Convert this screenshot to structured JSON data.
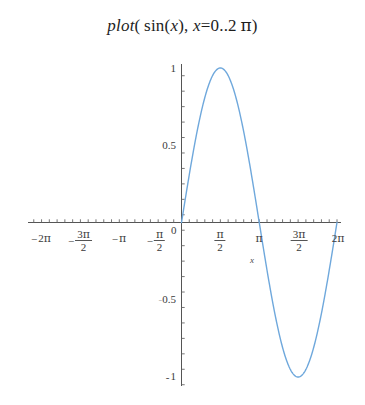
{
  "figure": {
    "background_color": "#ffffff",
    "title": {
      "full_text": "plot( sin(x), x = 0 ..2 π)",
      "fn_name": "plot",
      "open_paren": "(",
      "inner_fn": "sin",
      "inner_open": "(",
      "inner_var": "x",
      "inner_close": ")",
      "comma": ",",
      "range_var": "x",
      "equals": "=",
      "range_start": "0",
      "range_dots": "..",
      "range_end_coeff": "2",
      "range_end_symbol": "π",
      "close_paren": ")"
    }
  },
  "chart_data": {
    "type": "line",
    "xlabel": "x",
    "ylabel": "",
    "grid": false,
    "legend": null,
    "xlim": [
      -6.283185307,
      6.283185307
    ],
    "ylim": [
      -1,
      1
    ],
    "x_tick_labels": [
      "-2 π",
      "-3 π/2",
      "-π",
      "-π/2",
      "0",
      "π/2",
      "π",
      "3 π/2",
      "2 π"
    ],
    "x_tick_values": [
      -6.283185307,
      -4.71238898,
      -3.141592653,
      -1.570796327,
      0,
      1.570796327,
      3.141592653,
      4.71238898,
      6.283185307
    ],
    "y_tick_labels": [
      "1",
      "0.5",
      "0",
      "-0.5",
      "-1"
    ],
    "y_tick_values": [
      1,
      0.5,
      0,
      -0.5,
      -1
    ],
    "minor_tick_step_x": 0.3141592653,
    "minor_tick_step_y": 0.1,
    "series": [
      {
        "name": "sin(x)",
        "color": "#6fa8dc",
        "line_width": 1.4,
        "domain": [
          0,
          6.283185307
        ],
        "x": [
          0,
          0.1963,
          0.3927,
          0.589,
          0.7854,
          0.9817,
          1.1781,
          1.3744,
          1.5708,
          1.7671,
          1.9635,
          2.1598,
          2.3562,
          2.5525,
          2.7489,
          2.9452,
          3.1416,
          3.3379,
          3.5343,
          3.7306,
          3.927,
          4.1233,
          4.3197,
          4.516,
          4.7124,
          4.9087,
          5.1051,
          5.3014,
          5.4978,
          5.6941,
          5.8905,
          6.0868,
          6.2832
        ],
        "y": [
          0,
          0.1951,
          0.3827,
          0.5556,
          0.7071,
          0.8315,
          0.9239,
          0.9808,
          1,
          0.9808,
          0.9239,
          0.8315,
          0.7071,
          0.5556,
          0.3827,
          0.1951,
          0,
          -0.1951,
          -0.3827,
          -0.5556,
          -0.7071,
          -0.8315,
          -0.9239,
          -0.9808,
          -1,
          -0.9808,
          -0.9239,
          -0.8315,
          -0.7071,
          -0.5556,
          -0.3827,
          -0.1951,
          0
        ]
      }
    ]
  },
  "x_axis": {
    "variable_label": "x",
    "ticks": [
      {
        "id": "neg-2pi",
        "label_plain": "-2 π",
        "sign": "−",
        "coeff": "2",
        "symbol": "π",
        "fraction": false,
        "value": -6.283185307,
        "px": 41
      },
      {
        "id": "neg-3pi-over-2",
        "label_plain": "-3 π/2",
        "sign": "−",
        "coeff": "3",
        "symbol": "π",
        "fraction": true,
        "denominator": "2",
        "value": -4.71238898,
        "px": 80
      },
      {
        "id": "neg-pi",
        "label_plain": "-π",
        "sign": "−",
        "coeff": "",
        "symbol": "π",
        "fraction": false,
        "value": -3.141592653,
        "px": 119
      },
      {
        "id": "neg-pi-over-2",
        "label_plain": "-π/2",
        "sign": "−",
        "coeff": "",
        "symbol": "π",
        "fraction": true,
        "denominator": "2",
        "value": -1.570796327,
        "px": 155
      },
      {
        "id": "origin",
        "label_plain": "0",
        "sign": "",
        "coeff": "0",
        "symbol": "",
        "fraction": false,
        "value": 0,
        "px": 175
      },
      {
        "id": "pi-over-2",
        "label_plain": "π/2",
        "sign": "",
        "coeff": "",
        "symbol": "π",
        "fraction": true,
        "denominator": "2",
        "value": 1.570796327,
        "px": 220
      },
      {
        "id": "pi",
        "label_plain": "π",
        "sign": "",
        "coeff": "",
        "symbol": "π",
        "fraction": false,
        "value": 3.141592653,
        "px": 259
      },
      {
        "id": "3pi-over-2",
        "label_plain": "3 π/2",
        "sign": "",
        "coeff": "3",
        "symbol": "π",
        "fraction": true,
        "denominator": "2",
        "value": 4.71238898,
        "px": 298
      },
      {
        "id": "2pi",
        "label_plain": "2 π",
        "sign": "",
        "coeff": "2",
        "symbol": "π",
        "fraction": false,
        "value": 6.283185307,
        "px": 337
      }
    ]
  },
  "y_axis": {
    "ticks": [
      {
        "id": "y-1",
        "label": "1",
        "value": 1,
        "px": 68
      },
      {
        "id": "y-0-5",
        "label": "0.5",
        "value": 0.5,
        "px": 145
      },
      {
        "id": "y-neg-0-5",
        "label": "0.5",
        "negative_faint": "-",
        "value": -0.5,
        "px": 299
      },
      {
        "id": "y-neg-1",
        "label": "1",
        "negative": "-",
        "value": -1,
        "px": 377
      }
    ]
  },
  "colors": {
    "curve": "#6fa8dc",
    "axis": "#555555",
    "text": "#2b2b2b"
  }
}
